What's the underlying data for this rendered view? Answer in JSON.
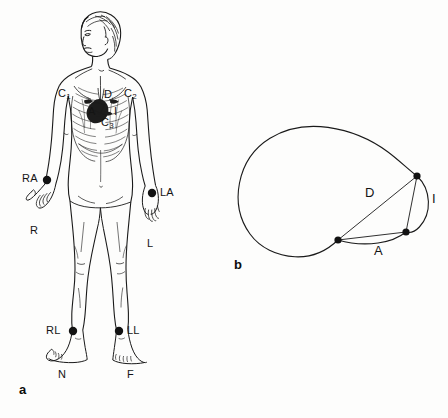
{
  "figure": {
    "type": "medical-illustration",
    "background_color": "#fdfdfc",
    "ink_color": "#1a1a1a",
    "panels": [
      {
        "id": "a",
        "label": "a",
        "caption": ""
      },
      {
        "id": "b",
        "label": "b",
        "caption": ""
      }
    ]
  },
  "panel_a": {
    "label": "a",
    "subject": "human-body-front-view",
    "limb_electrodes": [
      {
        "code": "RA",
        "name": "right-arm-electrode",
        "alt": "R",
        "x": 47,
        "y": 180
      },
      {
        "code": "LA",
        "name": "left-arm-electrode",
        "alt": "L",
        "x": 152,
        "y": 193
      },
      {
        "code": "RL",
        "name": "right-leg-electrode",
        "alt": "N",
        "x": 73,
        "y": 331
      },
      {
        "code": "LL",
        "name": "left-leg-electrode",
        "alt": "F",
        "x": 119,
        "y": 331
      }
    ],
    "limb_labels": {
      "right_arm": "RA",
      "left_arm": "LA",
      "right_leg": "RL",
      "left_leg": "LL"
    },
    "alt_labels": {
      "right_arm": "R",
      "left_arm": "L",
      "right_leg": "N",
      "left_leg": "F"
    },
    "chest_electrodes": [
      {
        "code": "C",
        "index": "1",
        "name": "chest-electrode-c1"
      },
      {
        "code": "C",
        "index": "2",
        "name": "chest-electrode-c2"
      },
      {
        "code": "C",
        "index": "3",
        "name": "chest-electrode-c3"
      }
    ],
    "heart_vectors": [
      {
        "code": "D",
        "name": "vector-d"
      },
      {
        "code": "A",
        "name": "vector-a"
      },
      {
        "code": "I",
        "name": "vector-i"
      }
    ]
  },
  "panel_b": {
    "label": "b",
    "subject": "torso-cross-section",
    "vertices": [
      {
        "name": "vertex-superior-right",
        "x": 417,
        "y": 176
      },
      {
        "name": "vertex-inferior-right",
        "x": 406,
        "y": 232
      },
      {
        "name": "vertex-left",
        "x": 338,
        "y": 240
      }
    ],
    "lead_labels": [
      {
        "code": "D",
        "name": "lead-d",
        "x": 368,
        "y": 192
      },
      {
        "code": "I",
        "name": "lead-i",
        "x": 434,
        "y": 198
      },
      {
        "code": "A",
        "name": "lead-a",
        "x": 377,
        "y": 250
      }
    ]
  }
}
